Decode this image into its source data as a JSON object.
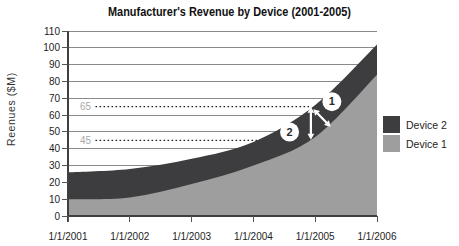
{
  "title": "Manufacturer's Revenue by Device (2001-2005)",
  "chart_data": {
    "type": "area",
    "stacked": true,
    "title": "Manufacturer's Revenue by Device (2001-2005)",
    "xlabel": "",
    "ylabel": "Reenues ($M)",
    "ylim": [
      0,
      110
    ],
    "ytick_step": 10,
    "grid": true,
    "legend_position": "right",
    "x_start_year": 2001,
    "categories": [
      "1/1/2001",
      "1/1/2002",
      "1/1/2003",
      "1/1/2004",
      "1/1/2005",
      "1/1/2006"
    ],
    "series": [
      {
        "name": "Device 1",
        "color": "#9e9e9e",
        "values": [
          10,
          11,
          19,
          30,
          47,
          84
        ]
      },
      {
        "name": "Device 2",
        "color": "#3d3d3f",
        "values": [
          16,
          17,
          15,
          14,
          19,
          18
        ]
      }
    ],
    "annotations": {
      "reference_lines": [
        {
          "label": "65",
          "value": 65
        },
        {
          "label": "45",
          "value": 45
        }
      ],
      "callouts": [
        {
          "label": "1",
          "circle": {
            "year": 2005.27,
            "value": 68
          },
          "arrow": {
            "from": {
              "year": 2004.97,
              "value": 63.5
            },
            "to": {
              "year": 2005.25,
              "value": 53
            }
          }
        },
        {
          "label": "2",
          "circle": {
            "year": 2004.585,
            "value": 49.9
          },
          "arrow": {
            "from": {
              "year": 2004.93,
              "value": 65
            },
            "to": {
              "year": 2004.93,
              "value": 45.3
            }
          }
        }
      ]
    }
  },
  "legend": {
    "entries": [
      {
        "label": "Device 2",
        "color": "#3d3d3f"
      },
      {
        "label": "Device 1",
        "color": "#9e9e9e"
      }
    ]
  }
}
